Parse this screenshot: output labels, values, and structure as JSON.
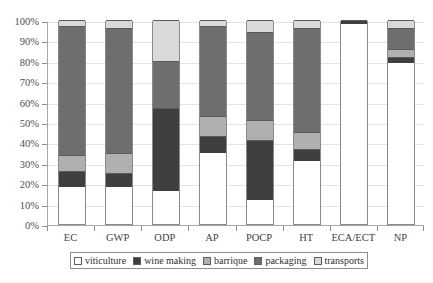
{
  "chart_data": {
    "type": "bar",
    "subtype": "stacked-percentage-column",
    "title": "",
    "xlabel": "",
    "ylabel": "",
    "ylim": [
      0,
      100
    ],
    "y_unit": "%",
    "grid": true,
    "legend_position": "bottom",
    "ytick_labels": [
      "100%",
      "90%",
      "80%",
      "70%",
      "60%",
      "50%",
      "40%",
      "30%",
      "20%",
      "10%",
      "0%"
    ],
    "ytick_values": [
      100,
      90,
      80,
      70,
      60,
      50,
      40,
      30,
      20,
      10,
      0
    ],
    "categories": [
      "EC",
      "GWP",
      "ODP",
      "AP",
      "POCP",
      "HT",
      "ECA/ECT",
      "NP"
    ],
    "series": [
      {
        "name": "viticulture",
        "color": "#ffffff",
        "values": [
          18,
          18,
          16,
          35,
          12,
          31,
          98,
          79
        ]
      },
      {
        "name": "wine making",
        "color": "#3f3f3f",
        "values": [
          8,
          7,
          41,
          8,
          29,
          6,
          2,
          3
        ]
      },
      {
        "name": "barrique",
        "color": "#b0b0b0",
        "values": [
          8,
          10,
          0,
          10,
          10,
          8,
          0,
          4
        ]
      },
      {
        "name": "packaging",
        "color": "#6e6e6e",
        "values": [
          63,
          61,
          23,
          44,
          43,
          51,
          0,
          10
        ]
      },
      {
        "name": "transports",
        "color": "#d9d9d9",
        "values": [
          3,
          4,
          20,
          3,
          6,
          4,
          0,
          4
        ]
      }
    ]
  },
  "legend": {
    "items": [
      {
        "label": "viticulture",
        "swatch": "#ffffff"
      },
      {
        "label": "wine making",
        "swatch": "#3f3f3f"
      },
      {
        "label": "barrique",
        "swatch": "#b0b0b0"
      },
      {
        "label": "packaging",
        "swatch": "#6e6e6e"
      },
      {
        "label": "transports",
        "swatch": "#d9d9d9"
      }
    ]
  }
}
